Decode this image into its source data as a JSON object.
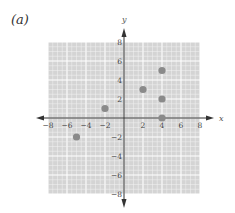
{
  "panel_label": "(a)",
  "colors": {
    "grid_bg": "#d4d4d4",
    "grid_line": "#f2f2f2",
    "grid_major": "#ffffff",
    "axis": "#333333",
    "point": "#8a8a8a"
  },
  "chart_data": {
    "type": "scatter",
    "title": "",
    "panel_label": "(a)",
    "xlabel": "x",
    "ylabel": "y",
    "xlim": [
      -8,
      8
    ],
    "ylim": [
      -8,
      8
    ],
    "grid": true,
    "x_ticks": [
      -8,
      -6,
      -4,
      -2,
      2,
      4,
      6,
      8
    ],
    "y_ticks": [
      8,
      6,
      4,
      2,
      -2,
      -4,
      -6,
      -8
    ],
    "x_tick_labels": [
      "−8",
      "−6",
      "−4",
      "−2",
      "2",
      "4",
      "6",
      "8"
    ],
    "y_tick_labels": [
      "8",
      "6",
      "4",
      "2",
      "−2",
      "−4",
      "−6",
      "−8"
    ],
    "series": [
      {
        "name": "points",
        "points": [
          {
            "x": -5,
            "y": -2
          },
          {
            "x": -2,
            "y": 1
          },
          {
            "x": 2,
            "y": 3
          },
          {
            "x": 4,
            "y": 5
          },
          {
            "x": 4,
            "y": 2
          },
          {
            "x": 4,
            "y": 0
          }
        ]
      }
    ]
  }
}
